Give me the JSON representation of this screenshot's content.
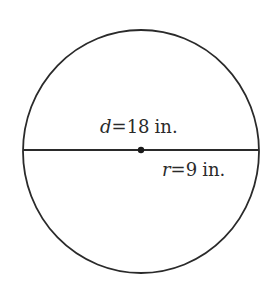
{
  "diagram": {
    "shape": "circle",
    "diameter_label": {
      "variable": "d",
      "equals": "=",
      "value": "18",
      "unit": "in."
    },
    "radius_label": {
      "variable": "r",
      "equals": "=",
      "value": "9",
      "unit": "in."
    },
    "colors": {
      "stroke": "#2a2a2a",
      "background": "#ffffff"
    }
  }
}
